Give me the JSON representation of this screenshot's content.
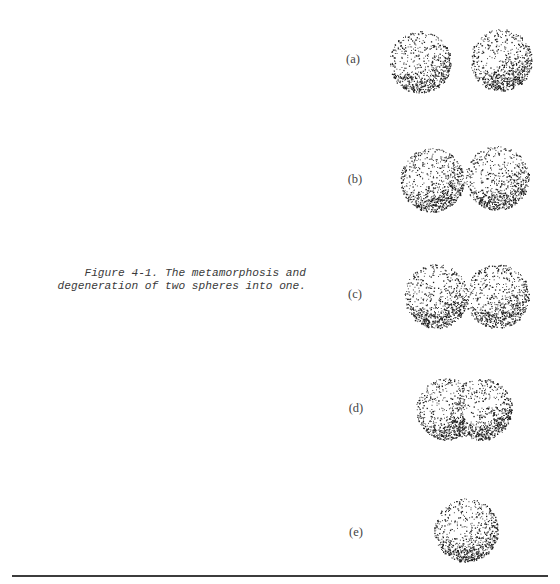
{
  "figure": {
    "number": "Figure 4-1.",
    "caption_line1": "Figure 4-1.  The metamorphosis and",
    "caption_line2": "degeneration of two spheres into one.",
    "panels": [
      {
        "label": "(a)",
        "description": "two separate spheres"
      },
      {
        "label": "(b)",
        "description": "two spheres touching"
      },
      {
        "label": "(c)",
        "description": "two spheres slightly overlapping"
      },
      {
        "label": "(d)",
        "description": "two spheres largely merged"
      },
      {
        "label": "(e)",
        "description": "single sphere"
      }
    ]
  }
}
